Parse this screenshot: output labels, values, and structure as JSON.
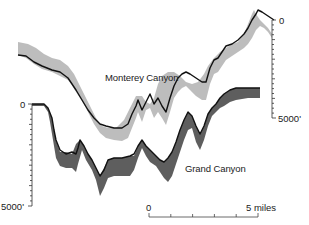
{
  "diagram": {
    "title": "",
    "profiles": [
      {
        "name": "Monterey Canyon",
        "label": "Monterey Canyon",
        "fill_color": "#bdbdbd",
        "line_color": "#111111"
      },
      {
        "name": "Grand Canyon",
        "label": "Grand Canyon",
        "fill_color": "#5e5e5e",
        "line_color": "#111111"
      }
    ],
    "depth_axis_right": {
      "top_label": "0",
      "bottom_label": "5000'",
      "applies_to": "Monterey Canyon"
    },
    "depth_axis_left": {
      "top_label": "0",
      "bottom_label": "5000'",
      "applies_to": "Grand Canyon"
    },
    "scale_bar": {
      "start_label": "0",
      "end_label": "5 miles",
      "divisions": 5
    }
  }
}
